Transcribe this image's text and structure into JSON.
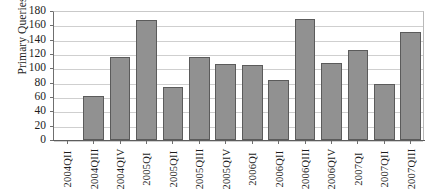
{
  "chart_data": {
    "type": "bar",
    "title": "",
    "xlabel": "",
    "ylabel": "Primary Queries",
    "ylim": [
      0,
      180
    ],
    "ytick_step": 20,
    "yticks": [
      180,
      160,
      140,
      120,
      100,
      80,
      60,
      40,
      20,
      0
    ],
    "grid": true,
    "legend": "none",
    "bar_color": "#919191",
    "bar_border_color": "#5b5b5b",
    "gridline_color": "#cfcfcf",
    "axis_color": "#5d5d5d",
    "categories": [
      "2004QII",
      "2004QIII",
      "2004QIV",
      "2005QI",
      "2005QII",
      "2005QIII",
      "2005QIV",
      "2006QI",
      "2006QII",
      "2006QIII",
      "2006QIV",
      "2007QI",
      "2007QII",
      "2007QIII"
    ],
    "values": [
      0,
      62,
      116,
      168,
      74,
      116,
      106,
      105,
      84,
      169,
      108,
      126,
      78,
      151
    ]
  }
}
